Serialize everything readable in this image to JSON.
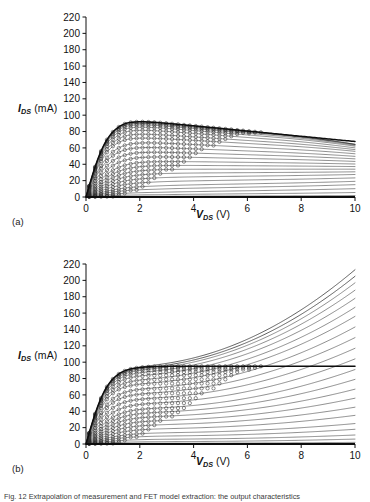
{
  "figure": {
    "caption": "Fig. 12  Extrapolation of measurement and FET model extraction: the output characteristics"
  },
  "panels": [
    {
      "tag": "(a)",
      "chart_data": {
        "type": "line",
        "title": "",
        "xlabel": "V_DS (V)",
        "ylabel": "I_DS (mA)",
        "xlabel_symbol": "V",
        "xlabel_sub": "DS",
        "xlabel_unit": "(V)",
        "ylabel_symbol": "I",
        "ylabel_sub": "DS",
        "ylabel_unit": "(mA)",
        "xlim": [
          0,
          10
        ],
        "ylim": [
          0,
          220
        ],
        "xticks": [
          0,
          2,
          4,
          6,
          8,
          10
        ],
        "yticks": [
          0,
          20,
          40,
          60,
          80,
          100,
          120,
          140,
          160,
          180,
          200,
          220
        ],
        "grid": false,
        "legend": "none",
        "marker": "open-circle",
        "series_note": "model lines with measured open-circle markers; 22 VGS steps",
        "model": "self-heating (negative output conductance beyond knee)",
        "series": [
          {
            "name": "VGS step 1",
            "idss": 95,
            "knee": 1.5,
            "slope_per_V": -3.2
          },
          {
            "name": "VGS step 2",
            "idss": 93,
            "knee": 1.5,
            "slope_per_V": -3.0
          },
          {
            "name": "VGS step 3",
            "idss": 91,
            "knee": 1.5,
            "slope_per_V": -2.9
          },
          {
            "name": "VGS step 4",
            "idss": 88,
            "knee": 1.5,
            "slope_per_V": -2.7
          },
          {
            "name": "VGS step 5",
            "idss": 84,
            "knee": 1.5,
            "slope_per_V": -2.5
          },
          {
            "name": "VGS step 6",
            "idss": 79,
            "knee": 1.5,
            "slope_per_V": -2.2
          },
          {
            "name": "VGS step 7",
            "idss": 74,
            "knee": 1.5,
            "slope_per_V": -1.9
          },
          {
            "name": "VGS step 8",
            "idss": 68,
            "knee": 1.6,
            "slope_per_V": -1.6
          },
          {
            "name": "VGS step 9",
            "idss": 62,
            "knee": 1.6,
            "slope_per_V": -1.3
          },
          {
            "name": "VGS step 10",
            "idss": 56,
            "knee": 1.7,
            "slope_per_V": -1.0
          },
          {
            "name": "VGS step 11",
            "idss": 50,
            "knee": 1.8,
            "slope_per_V": -0.7
          },
          {
            "name": "VGS step 12",
            "idss": 44,
            "knee": 1.9,
            "slope_per_V": -0.4
          },
          {
            "name": "VGS step 13",
            "idss": 39,
            "knee": 2.0,
            "slope_per_V": -0.2
          },
          {
            "name": "VGS step 14",
            "idss": 34,
            "knee": 2.1,
            "slope_per_V": 0.0
          },
          {
            "name": "VGS step 15",
            "idss": 29,
            "knee": 2.2,
            "slope_per_V": 0.2
          },
          {
            "name": "VGS step 16",
            "idss": 24,
            "knee": 2.3,
            "slope_per_V": 0.4
          },
          {
            "name": "VGS step 17",
            "idss": 19,
            "knee": 2.4,
            "slope_per_V": 0.5
          },
          {
            "name": "VGS step 18",
            "idss": 14,
            "knee": 2.5,
            "slope_per_V": 0.6
          },
          {
            "name": "VGS step 19",
            "idss": 10,
            "knee": 2.6,
            "slope_per_V": 0.6
          },
          {
            "name": "VGS step 20",
            "idss": 6,
            "knee": 2.7,
            "slope_per_V": 0.5
          },
          {
            "name": "VGS step 21",
            "idss": 3,
            "knee": 2.8,
            "slope_per_V": 0.3
          },
          {
            "name": "VGS step 22",
            "idss": 1,
            "knee": 2.9,
            "slope_per_V": 0.1
          }
        ]
      }
    },
    {
      "tag": "(b)",
      "chart_data": {
        "type": "line",
        "title": "",
        "xlabel": "V_DS (V)",
        "ylabel": "I_DS (mA)",
        "xlabel_symbol": "V",
        "xlabel_sub": "DS",
        "xlabel_unit": "(V)",
        "ylabel_symbol": "I",
        "ylabel_sub": "DS",
        "ylabel_unit": "(mA)",
        "xlim": [
          0,
          10
        ],
        "ylim": [
          0,
          220
        ],
        "xticks": [
          0,
          2,
          4,
          6,
          8,
          10
        ],
        "yticks": [
          0,
          20,
          40,
          60,
          80,
          100,
          120,
          140,
          160,
          180,
          200,
          220
        ],
        "grid": false,
        "legend": "none",
        "marker": "open-circle",
        "series_note": "model lines with measured open-circle markers; 22 VGS steps",
        "model": "no self-heating (curves diverge upward beyond measured range)",
        "series": [
          {
            "name": "VGS step 1",
            "idss": 95,
            "knee": 1.5,
            "growth": 118
          },
          {
            "name": "VGS step 2",
            "idss": 93,
            "knee": 1.5,
            "growth": 112
          },
          {
            "name": "VGS step 3",
            "idss": 91,
            "knee": 1.5,
            "growth": 106
          },
          {
            "name": "VGS step 4",
            "idss": 88,
            "knee": 1.5,
            "growth": 100
          },
          {
            "name": "VGS step 5",
            "idss": 84,
            "knee": 1.5,
            "growth": 94
          },
          {
            "name": "VGS step 6",
            "idss": 79,
            "knee": 1.5,
            "growth": 88
          },
          {
            "name": "VGS step 7",
            "idss": 74,
            "knee": 1.5,
            "growth": 82
          },
          {
            "name": "VGS step 8",
            "idss": 68,
            "knee": 1.6,
            "growth": 75
          },
          {
            "name": "VGS step 9",
            "idss": 62,
            "knee": 1.6,
            "growth": 68
          },
          {
            "name": "VGS step 10",
            "idss": 56,
            "knee": 1.7,
            "growth": 61
          },
          {
            "name": "VGS step 11",
            "idss": 50,
            "knee": 1.8,
            "growth": 54
          },
          {
            "name": "VGS step 12",
            "idss": 44,
            "knee": 1.9,
            "growth": 47
          },
          {
            "name": "VGS step 13",
            "idss": 39,
            "knee": 2.0,
            "growth": 40
          },
          {
            "name": "VGS step 14",
            "idss": 34,
            "knee": 2.1,
            "growth": 33
          },
          {
            "name": "VGS step 15",
            "idss": 29,
            "knee": 2.2,
            "growth": 27
          },
          {
            "name": "VGS step 16",
            "idss": 24,
            "knee": 2.3,
            "growth": 21
          },
          {
            "name": "VGS step 17",
            "idss": 19,
            "knee": 2.4,
            "growth": 16
          },
          {
            "name": "VGS step 18",
            "idss": 14,
            "knee": 2.5,
            "growth": 11
          },
          {
            "name": "VGS step 19",
            "idss": 10,
            "knee": 2.6,
            "growth": 8
          },
          {
            "name": "VGS step 20",
            "idss": 6,
            "knee": 2.7,
            "growth": 5
          },
          {
            "name": "VGS step 21",
            "idss": 3,
            "knee": 2.8,
            "growth": 3
          },
          {
            "name": "VGS step 22",
            "idss": 1,
            "knee": 2.9,
            "growth": 1
          }
        ]
      }
    }
  ],
  "colors": {
    "axis": "#111111",
    "curve": "#333333",
    "marker": "#2a2a2a",
    "background": "#ffffff"
  }
}
